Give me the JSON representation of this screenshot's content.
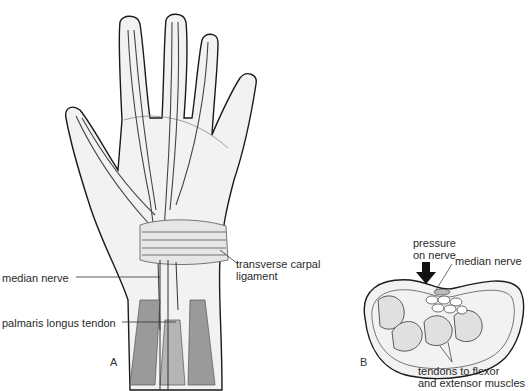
{
  "figure": {
    "panel_a": {
      "letter": "A",
      "subject": "palm view of hand and wrist",
      "labels": {
        "median_nerve": "median nerve",
        "transverse_carpal_ligament_line1": "transverse carpal",
        "transverse_carpal_ligament_line2": "ligament",
        "palmaris_longus_tendon": "palmaris longus tendon"
      }
    },
    "panel_b": {
      "letter": "B",
      "subject": "cross-section of wrist (carpal tunnel)",
      "labels": {
        "pressure_line1": "pressure",
        "pressure_line2": "on nerve",
        "median_nerve": "median nerve",
        "tendons_line1": "tendons to flexor",
        "tendons_line2": "and extensor muscles"
      }
    },
    "colors": {
      "outline": "#1a1a1a",
      "skin_fill": "#f0f0f0",
      "muscle_gray": "#9a9a9a",
      "arrow": "#111111"
    }
  }
}
